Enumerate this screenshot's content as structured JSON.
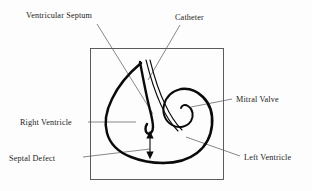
{
  "figure": {
    "kind": "anatomical-line-diagram",
    "background_color": "#fdfdfd",
    "ink_color": "#0a0a0a",
    "leader_color": "#55555a",
    "frame_color": "#4a4a4f"
  },
  "labels": {
    "ventricular_septum": "Ventricular Septum",
    "catheter": "Catheter",
    "mitral_valve": "Mitral Valve",
    "right_ventricle": "Right Ventricle",
    "septal_defect": "Septal Defect",
    "left_ventricle": "Left Ventricle"
  },
  "structures": [
    {
      "name": "right-ventricle-free-wall",
      "kind": "outline"
    },
    {
      "name": "ventricular-septum",
      "kind": "outline"
    },
    {
      "name": "left-ventricle-wall",
      "kind": "outline"
    },
    {
      "name": "mitral-valve-leaflet",
      "kind": "outline"
    },
    {
      "name": "catheter",
      "kind": "instrument"
    },
    {
      "name": "septal-defect-marker",
      "kind": "annotation-arrow"
    }
  ]
}
